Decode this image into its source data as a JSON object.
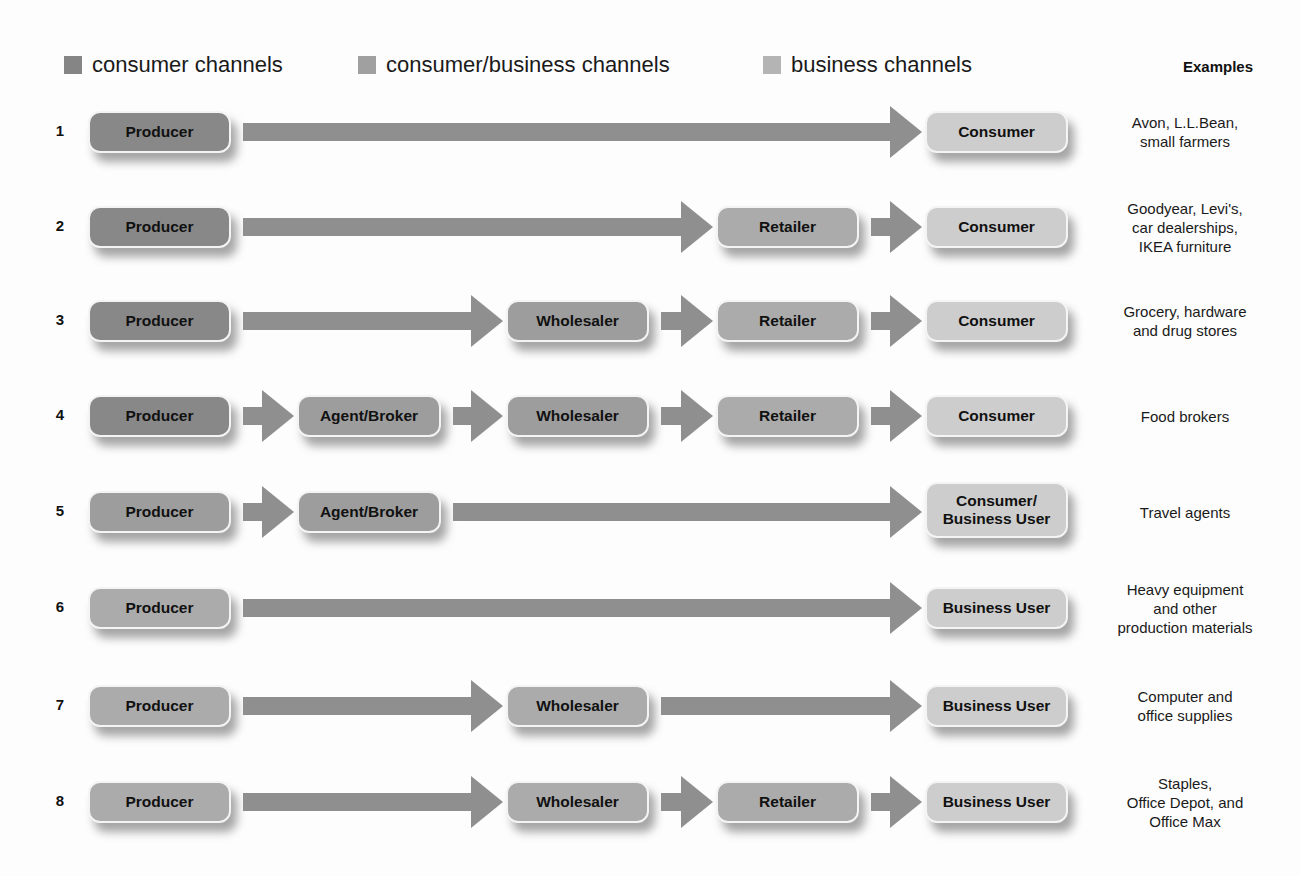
{
  "legend": [
    {
      "label": "consumer channels",
      "color": "#858585",
      "left": 64
    },
    {
      "label": "consumer/business channels",
      "color": "#a0a0a0",
      "left": 358
    },
    {
      "label": "business channels",
      "color": "#b4b4b4",
      "left": 763
    }
  ],
  "examples_header": "Examples",
  "colors": {
    "producer_consumer": "#888888",
    "intermediary": "#9d9d9d",
    "retailer": "#ababab",
    "end_user": "#cdcdcd",
    "arrow": "#8f8f8f"
  },
  "rows": [
    {
      "number": "1",
      "nodes": [
        "Producer",
        null,
        null,
        null,
        "Consumer"
      ],
      "example": "Avon, L.L.Bean,\nsmall farmers"
    },
    {
      "number": "2",
      "nodes": [
        "Producer",
        null,
        null,
        "Retailer",
        "Consumer"
      ],
      "example": "Goodyear, Levi's,\ncar dealerships,\nIKEA furniture"
    },
    {
      "number": "3",
      "nodes": [
        "Producer",
        null,
        "Wholesaler",
        "Retailer",
        "Consumer"
      ],
      "example": "Grocery, hardware\nand drug stores"
    },
    {
      "number": "4",
      "nodes": [
        "Producer",
        "Agent/Broker",
        "Wholesaler",
        "Retailer",
        "Consumer"
      ],
      "example": "Food brokers"
    },
    {
      "number": "5",
      "nodes": [
        "Producer",
        "Agent/Broker",
        null,
        null,
        "Consumer/\nBusiness User"
      ],
      "example": "Travel agents"
    },
    {
      "number": "6",
      "nodes": [
        "Producer",
        null,
        null,
        null,
        "Business User"
      ],
      "example": "Heavy equipment\nand other\nproduction materials"
    },
    {
      "number": "7",
      "nodes": [
        "Producer",
        null,
        "Wholesaler",
        null,
        "Business User"
      ],
      "example": "Computer and\noffice supplies"
    },
    {
      "number": "8",
      "nodes": [
        "Producer",
        null,
        "Wholesaler",
        "Retailer",
        "Business User"
      ],
      "example": "Staples,\nOffice Depot, and\nOffice Max"
    }
  ]
}
